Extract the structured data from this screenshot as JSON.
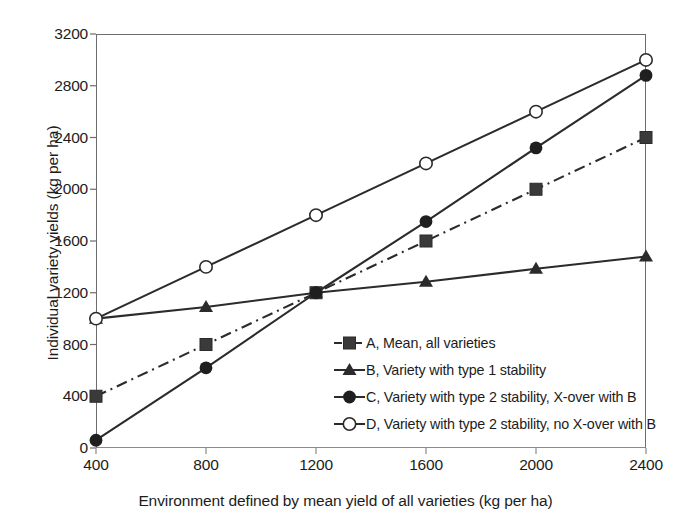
{
  "chart_data": {
    "type": "line",
    "title": "",
    "xlabel": "Environment defined by mean yield of all varieties (kg per ha)",
    "ylabel": "Individual variety yields (kg per ha)",
    "x": [
      400,
      800,
      1200,
      1600,
      2000,
      2400
    ],
    "xlim": [
      400,
      2400
    ],
    "ylim": [
      0,
      3200
    ],
    "xticks": [
      "400",
      "800",
      "1200",
      "1600",
      "2000",
      "2400"
    ],
    "yticks": [
      "0",
      "400",
      "800",
      "1200",
      "1600",
      "2000",
      "2400",
      "2800",
      "3200"
    ],
    "grid": false,
    "legend_position": "inside-lower-right",
    "series": [
      {
        "name": "A, Mean, all varieties",
        "marker": "filled-square",
        "linestyle": "dash-dot",
        "color": "#2b2b2b",
        "values": [
          400,
          800,
          1200,
          1600,
          2000,
          2400
        ]
      },
      {
        "name": "B, Variety with type 1 stability",
        "marker": "filled-triangle",
        "linestyle": "solid",
        "color": "#2b2b2b",
        "values": [
          1000,
          1090,
          1200,
          1285,
          1385,
          1480
        ]
      },
      {
        "name": "C, Variety with type 2 stability, X-over with B",
        "marker": "filled-circle",
        "linestyle": "solid",
        "color": "#2b2b2b",
        "values": [
          60,
          620,
          1200,
          1750,
          2320,
          2880
        ]
      },
      {
        "name": "D, Variety with type 2 stability, no X-over with B",
        "marker": "open-circle",
        "linestyle": "solid",
        "color": "#2b2b2b",
        "values": [
          1000,
          1400,
          1800,
          2200,
          2600,
          3000
        ]
      }
    ]
  },
  "legend": {
    "items": [
      {
        "label": "A, Mean, all varieties",
        "key": "dash-dot-square-key"
      },
      {
        "label": "B, Variety with type 1 stability",
        "key": "solid-triangle-key"
      },
      {
        "label": "C, Variety with type 2 stability, X-over with B",
        "key": "solid-circle-key"
      },
      {
        "label": "D, Variety with type 2 stability, no X-over with B",
        "key": "solid-open-circle-key"
      }
    ]
  },
  "axes": {
    "x_title": "Environment defined by mean yield of all varieties (kg per ha)",
    "y_title": "Individual variety yields (kg per ha)"
  }
}
